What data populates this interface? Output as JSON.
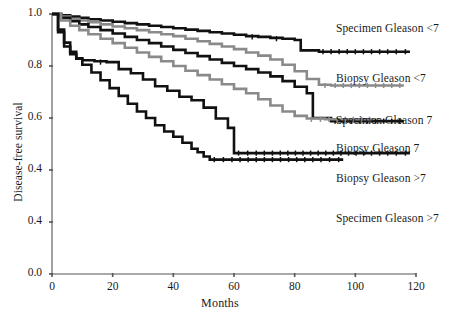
{
  "chart_data": {
    "type": "line",
    "title": "",
    "xlabel": "Months",
    "ylabel": "Disease-free survival",
    "xlim": [
      0,
      120
    ],
    "ylim": [
      0.0,
      1.0
    ],
    "xticks": [
      "0",
      "20",
      "40",
      "60",
      "80",
      "100",
      "120"
    ],
    "xtick_values": [
      0,
      20,
      40,
      60,
      80,
      100,
      120
    ],
    "yticks": [
      "1.0",
      "0.8",
      "0.6",
      "0.4",
      "0.4",
      "0.0"
    ],
    "ytick_values": [
      1.0,
      0.8,
      0.6,
      0.4,
      0.2,
      0.0
    ],
    "grid": false,
    "legend_position": "right-inline",
    "series": [
      {
        "name": "Specimen Gleason <7",
        "color": "#111111",
        "label_x": 336,
        "label_y": 22,
        "x": [
          0,
          3,
          6,
          9,
          12,
          16,
          20,
          24,
          28,
          32,
          36,
          40,
          44,
          48,
          52,
          56,
          60,
          64,
          68,
          72,
          76,
          80,
          82,
          88,
          96,
          104,
          112,
          118
        ],
        "y": [
          1.0,
          0.995,
          0.99,
          0.985,
          0.98,
          0.975,
          0.97,
          0.965,
          0.96,
          0.955,
          0.95,
          0.945,
          0.94,
          0.935,
          0.93,
          0.925,
          0.92,
          0.915,
          0.912,
          0.908,
          0.905,
          0.9,
          0.86,
          0.855,
          0.855,
          0.855,
          0.855,
          0.855
        ]
      },
      {
        "name": "Biopsy Gleason <7",
        "color": "#8a8a8a",
        "label_x": 336,
        "label_y": 72,
        "x": [
          0,
          3,
          6,
          9,
          12,
          16,
          20,
          24,
          28,
          32,
          36,
          40,
          44,
          48,
          52,
          56,
          60,
          64,
          68,
          72,
          76,
          80,
          84,
          88,
          92,
          100,
          108,
          116
        ],
        "y": [
          1.0,
          0.99,
          0.982,
          0.975,
          0.968,
          0.96,
          0.952,
          0.945,
          0.938,
          0.93,
          0.922,
          0.915,
          0.905,
          0.895,
          0.885,
          0.875,
          0.865,
          0.852,
          0.84,
          0.825,
          0.805,
          0.78,
          0.75,
          0.728,
          0.725,
          0.725,
          0.725,
          0.725
        ]
      },
      {
        "name": "Specimen Gleason 7",
        "color": "#111111",
        "label_x": 336,
        "label_y": 114,
        "x": [
          0,
          3,
          6,
          9,
          12,
          16,
          20,
          24,
          28,
          32,
          36,
          40,
          44,
          48,
          52,
          56,
          60,
          64,
          68,
          72,
          76,
          80,
          84,
          86,
          92,
          100,
          108,
          116
        ],
        "y": [
          1.0,
          0.985,
          0.972,
          0.96,
          0.95,
          0.938,
          0.925,
          0.912,
          0.9,
          0.888,
          0.875,
          0.862,
          0.85,
          0.838,
          0.825,
          0.812,
          0.8,
          0.788,
          0.775,
          0.76,
          0.742,
          0.72,
          0.695,
          0.6,
          0.588,
          0.588,
          0.588,
          0.588
        ]
      },
      {
        "name": "Biopsy Gleason 7",
        "color": "#8a8a8a",
        "label_x": 336,
        "label_y": 142,
        "x": [
          0,
          3,
          6,
          9,
          12,
          16,
          20,
          24,
          28,
          32,
          36,
          40,
          44,
          48,
          52,
          56,
          60,
          64,
          68,
          72,
          76,
          80,
          84,
          90,
          98,
          106
        ],
        "y": [
          1.0,
          0.975,
          0.955,
          0.938,
          0.922,
          0.905,
          0.888,
          0.87,
          0.852,
          0.835,
          0.818,
          0.8,
          0.782,
          0.765,
          0.748,
          0.73,
          0.712,
          0.695,
          0.672,
          0.648,
          0.625,
          0.608,
          0.598,
          0.595,
          0.595,
          0.595
        ]
      },
      {
        "name": "Biopsy Gleason >7",
        "color": "#111111",
        "label_x": 336,
        "label_y": 172,
        "x": [
          0,
          2,
          4,
          6,
          8,
          10,
          14,
          18,
          22,
          26,
          30,
          34,
          38,
          42,
          46,
          50,
          54,
          58,
          60,
          66,
          74,
          84,
          94,
          104,
          112,
          118
        ],
        "y": [
          1.0,
          0.93,
          0.875,
          0.845,
          0.828,
          0.822,
          0.818,
          0.815,
          0.788,
          0.772,
          0.748,
          0.722,
          0.705,
          0.682,
          0.668,
          0.64,
          0.598,
          0.562,
          0.465,
          0.465,
          0.465,
          0.465,
          0.465,
          0.465,
          0.465,
          0.465
        ]
      },
      {
        "name": "Specimen Gleason >7",
        "color": "#111111",
        "label_x": 336,
        "label_y": 212,
        "x": [
          0,
          2,
          4,
          6,
          8,
          10,
          13,
          16,
          19,
          22,
          25,
          28,
          31,
          34,
          37,
          40,
          43,
          46,
          48,
          50,
          52,
          58,
          66,
          74,
          82,
          90,
          96
        ],
        "y": [
          1.0,
          0.94,
          0.89,
          0.855,
          0.83,
          0.805,
          0.775,
          0.745,
          0.715,
          0.685,
          0.655,
          0.625,
          0.6,
          0.572,
          0.548,
          0.528,
          0.505,
          0.482,
          0.468,
          0.452,
          0.44,
          0.44,
          0.44,
          0.44,
          0.44,
          0.44,
          0.44
        ]
      }
    ]
  }
}
